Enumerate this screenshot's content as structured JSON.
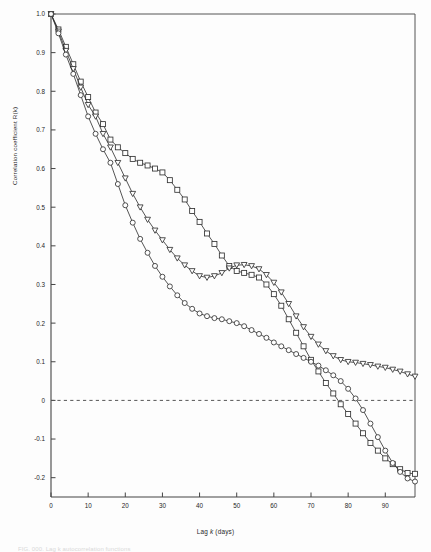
{
  "figure": {
    "xlabel_pre": "Lag ",
    "xlabel_var": "k",
    "xlabel_post": " (days)",
    "ylabel": "Correlation coefficient R(k)",
    "caption": "FIG. 000.  Lag  k  autocorrelation  functions"
  },
  "chart_data": {
    "type": "line",
    "title": "",
    "xlabel": "Lag k (days)",
    "ylabel": "Correlation coefficient R(k)",
    "xlim": [
      0,
      98
    ],
    "ylim": [
      -0.25,
      1.0
    ],
    "xticks": [
      0,
      10,
      20,
      30,
      40,
      50,
      60,
      70,
      80,
      90
    ],
    "yticks": [
      -0.2,
      -0.1,
      0,
      0.1,
      0.2,
      0.3,
      0.4,
      0.5,
      0.6,
      0.7,
      0.8,
      0.9,
      1.0
    ],
    "ytick_labels": [
      "-0.2",
      "-0.1",
      "0",
      "0.1",
      "0.2",
      "0.3",
      "0.4",
      "0.5",
      "0.6",
      "0.7",
      "0.8",
      "0.9",
      "1.0"
    ],
    "xtick_labels": [
      "0",
      "10",
      "20",
      "30",
      "40",
      "50",
      "60",
      "70",
      "80",
      "90"
    ],
    "grid": false,
    "legend": "none",
    "zero_reference_line": {
      "y": 0,
      "style": "dashed"
    },
    "series": [
      {
        "name": "series-square",
        "marker": "square",
        "x": [
          0,
          2,
          4,
          6,
          8,
          10,
          12,
          14,
          16,
          18,
          20,
          22,
          24,
          26,
          28,
          30,
          32,
          34,
          36,
          38,
          40,
          42,
          44,
          46,
          48,
          50,
          52,
          54,
          56,
          58,
          60,
          62,
          64,
          66,
          68,
          70,
          72,
          74,
          76,
          78,
          80,
          82,
          84,
          86,
          88,
          90,
          92,
          94,
          96,
          98
        ],
        "y": [
          1.0,
          0.96,
          0.915,
          0.87,
          0.825,
          0.785,
          0.745,
          0.715,
          0.675,
          0.655,
          0.64,
          0.625,
          0.615,
          0.608,
          0.6,
          0.59,
          0.57,
          0.545,
          0.52,
          0.49,
          0.462,
          0.432,
          0.405,
          0.375,
          0.348,
          0.335,
          0.33,
          0.325,
          0.318,
          0.3,
          0.275,
          0.245,
          0.21,
          0.175,
          0.14,
          0.105,
          0.075,
          0.045,
          0.018,
          -0.01,
          -0.035,
          -0.06,
          -0.085,
          -0.11,
          -0.13,
          -0.15,
          -0.165,
          -0.178,
          -0.188,
          -0.19
        ]
      },
      {
        "name": "series-triangle",
        "marker": "triangle-down",
        "x": [
          0,
          2,
          4,
          6,
          8,
          10,
          12,
          14,
          16,
          18,
          20,
          22,
          24,
          26,
          28,
          30,
          32,
          34,
          36,
          38,
          40,
          42,
          44,
          46,
          48,
          50,
          52,
          54,
          56,
          58,
          60,
          62,
          64,
          66,
          68,
          70,
          72,
          74,
          76,
          78,
          80,
          82,
          84,
          86,
          88,
          90,
          92,
          94,
          96,
          98
        ],
        "y": [
          1.0,
          0.955,
          0.905,
          0.858,
          0.81,
          0.765,
          0.735,
          0.69,
          0.655,
          0.615,
          0.575,
          0.535,
          0.5,
          0.468,
          0.44,
          0.415,
          0.39,
          0.368,
          0.35,
          0.335,
          0.322,
          0.318,
          0.322,
          0.33,
          0.342,
          0.35,
          0.351,
          0.348,
          0.34,
          0.325,
          0.305,
          0.28,
          0.25,
          0.218,
          0.19,
          0.165,
          0.145,
          0.128,
          0.115,
          0.105,
          0.1,
          0.098,
          0.095,
          0.092,
          0.088,
          0.085,
          0.08,
          0.075,
          0.068,
          0.062
        ]
      },
      {
        "name": "series-circle",
        "marker": "circle",
        "x": [
          0,
          2,
          4,
          6,
          8,
          10,
          12,
          14,
          16,
          18,
          20,
          22,
          24,
          26,
          28,
          30,
          32,
          34,
          36,
          38,
          40,
          42,
          44,
          46,
          48,
          50,
          52,
          54,
          56,
          58,
          60,
          62,
          64,
          66,
          68,
          70,
          72,
          74,
          76,
          78,
          80,
          82,
          84,
          86,
          88,
          90,
          92,
          94,
          96,
          98
        ],
        "y": [
          1.0,
          0.95,
          0.895,
          0.845,
          0.79,
          0.735,
          0.69,
          0.65,
          0.615,
          0.56,
          0.505,
          0.46,
          0.418,
          0.382,
          0.348,
          0.32,
          0.295,
          0.272,
          0.252,
          0.237,
          0.225,
          0.218,
          0.213,
          0.21,
          0.205,
          0.2,
          0.192,
          0.182,
          0.172,
          0.162,
          0.15,
          0.14,
          0.13,
          0.12,
          0.11,
          0.1,
          0.09,
          0.078,
          0.065,
          0.05,
          0.03,
          0.005,
          -0.025,
          -0.06,
          -0.095,
          -0.13,
          -0.162,
          -0.185,
          -0.202,
          -0.21
        ]
      }
    ]
  }
}
